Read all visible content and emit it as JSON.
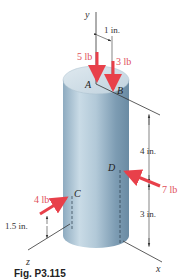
{
  "figure": {
    "caption": "Fig. P3.115",
    "axes": {
      "y": "y",
      "x": "x",
      "z": "z"
    },
    "points": {
      "A": "A",
      "B": "B",
      "C": "C",
      "D": "D"
    },
    "forces": [
      {
        "id": "force-a",
        "point": "A",
        "label": "5 lb",
        "direction": "down"
      },
      {
        "id": "force-b",
        "point": "B",
        "label": "3 lb",
        "direction": "down"
      },
      {
        "id": "force-c",
        "point": "C",
        "label": "4 lb",
        "direction": "toward cylinder"
      },
      {
        "id": "force-d",
        "point": "D",
        "label": "7 lb",
        "direction": "toward cylinder"
      }
    ],
    "dimensions": {
      "ab_offset": "1 in.",
      "top_to_d": "4 in.",
      "d_height": "3 in.",
      "c_height": "1.5 in."
    },
    "colors": {
      "force": "#e8404a",
      "label_force": "#e0505a",
      "cylinder_light": "#d4e2ea",
      "cylinder_dark": "#6f8fa6",
      "line": "#333333"
    }
  }
}
